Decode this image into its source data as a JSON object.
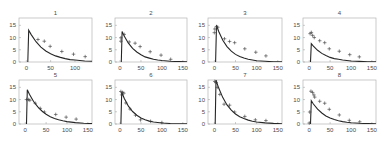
{
  "chart_data": {
    "type": "line",
    "ylim": [
      0,
      18
    ],
    "yticks": [
      0,
      5,
      10,
      15
    ],
    "grid": false,
    "legend": null,
    "panels": [
      {
        "title": "1",
        "xlim": [
          -15,
          135
        ],
        "xticks": [
          0,
          50,
          100
        ],
        "curve": [
          [
            3,
            0
          ],
          [
            5,
            13
          ],
          [
            10,
            11.2
          ],
          [
            20,
            8.3
          ],
          [
            30,
            6.1
          ],
          [
            40,
            4.5
          ],
          [
            50,
            3.4
          ],
          [
            60,
            2.5
          ],
          [
            70,
            1.9
          ],
          [
            80,
            1.4
          ],
          [
            90,
            1.0
          ],
          [
            100,
            0.8
          ],
          [
            110,
            0.6
          ],
          [
            120,
            0.4
          ],
          [
            135,
            0.3
          ]
        ],
        "observed": [
          [
            24,
            9.2
          ],
          [
            37,
            8.5
          ],
          [
            49,
            6.4
          ],
          [
            73,
            4.3
          ],
          [
            97,
            3.2
          ],
          [
            121,
            2.2
          ]
        ]
      },
      {
        "title": "2",
        "xlim": [
          -12,
          160
        ],
        "xticks": [
          0,
          50,
          100,
          150
        ],
        "curve": [
          [
            3,
            0
          ],
          [
            5,
            12.5
          ],
          [
            10,
            10.6
          ],
          [
            20,
            7.7
          ],
          [
            30,
            5.6
          ],
          [
            40,
            4.1
          ],
          [
            50,
            3.0
          ],
          [
            60,
            2.1
          ],
          [
            70,
            1.6
          ],
          [
            80,
            1.1
          ],
          [
            90,
            0.8
          ],
          [
            100,
            0.6
          ],
          [
            120,
            0.3
          ],
          [
            140,
            0.17
          ],
          [
            160,
            0.09
          ]
        ],
        "observed": [
          [
            2,
            9.9
          ],
          [
            2,
            8.5
          ],
          [
            10,
            11.3
          ],
          [
            22,
            8.2
          ],
          [
            36,
            7.7
          ],
          [
            48,
            6.3
          ],
          [
            72,
            4.2
          ],
          [
            98,
            2.8
          ],
          [
            121,
            1.1
          ]
        ]
      },
      {
        "title": "3",
        "xlim": [
          -15,
          160
        ],
        "xticks": [
          0,
          50,
          100,
          150
        ],
        "curve": [
          [
            3,
            0
          ],
          [
            5,
            15
          ],
          [
            10,
            12.6
          ],
          [
            20,
            8.9
          ],
          [
            30,
            6.3
          ],
          [
            40,
            4.4
          ],
          [
            50,
            3.1
          ],
          [
            60,
            2.2
          ],
          [
            70,
            1.6
          ],
          [
            80,
            1.1
          ],
          [
            90,
            0.8
          ],
          [
            100,
            0.5
          ],
          [
            120,
            0.27
          ],
          [
            140,
            0.13
          ],
          [
            160,
            0.07
          ]
        ],
        "observed": [
          [
            0,
            12
          ],
          [
            1,
            13.5
          ],
          [
            5,
            14.5
          ],
          [
            8,
            14.2
          ],
          [
            24,
            9.5
          ],
          [
            36,
            8.4
          ],
          [
            48,
            7.9
          ],
          [
            72,
            5.4
          ],
          [
            98,
            4.0
          ],
          [
            122,
            2.5
          ]
        ]
      },
      {
        "title": "4",
        "xlim": [
          -15,
          160
        ],
        "xticks": [
          0,
          50,
          100,
          150
        ],
        "curve": [
          [
            3,
            0
          ],
          [
            5,
            7.5
          ],
          [
            10,
            6.5
          ],
          [
            20,
            4.8
          ],
          [
            30,
            3.5
          ],
          [
            40,
            2.6
          ],
          [
            50,
            1.9
          ],
          [
            60,
            1.4
          ],
          [
            70,
            1.1
          ],
          [
            80,
            0.8
          ],
          [
            90,
            0.6
          ],
          [
            100,
            0.4
          ],
          [
            120,
            0.24
          ],
          [
            140,
            0.13
          ],
          [
            160,
            0.07
          ]
        ],
        "observed": [
          [
            2,
            11.6
          ],
          [
            5,
            12.1
          ],
          [
            8,
            10.9
          ],
          [
            12,
            10
          ],
          [
            25,
            8.7
          ],
          [
            37,
            7.9
          ],
          [
            48,
            5.4
          ],
          [
            72,
            4.4
          ],
          [
            97,
            3.0
          ],
          [
            120,
            2.1
          ]
        ]
      },
      {
        "title": "5",
        "xlim": [
          -15,
          160
        ],
        "xticks": [
          0,
          50,
          100,
          150
        ],
        "curve": [
          [
            3,
            0
          ],
          [
            5,
            14
          ],
          [
            10,
            12.2
          ],
          [
            20,
            9.2
          ],
          [
            30,
            7.0
          ],
          [
            40,
            5.3
          ],
          [
            50,
            4.0
          ],
          [
            60,
            3.0
          ],
          [
            70,
            2.3
          ],
          [
            80,
            1.7
          ],
          [
            90,
            1.3
          ],
          [
            100,
            1.0
          ],
          [
            120,
            0.56
          ],
          [
            140,
            0.32
          ],
          [
            160,
            0.18
          ]
        ],
        "observed": [
          [
            3,
            10
          ],
          [
            8,
            10
          ],
          [
            11,
            9.7
          ],
          [
            24,
            8.5
          ],
          [
            36,
            6.4
          ],
          [
            46,
            4.9
          ],
          [
            73,
            3.9
          ],
          [
            98,
            2.8
          ],
          [
            122,
            2.0
          ]
        ]
      },
      {
        "title": "6",
        "xlim": [
          -12,
          160
        ],
        "xticks": [
          0,
          50,
          100,
          150
        ],
        "curve": [
          [
            2,
            0
          ],
          [
            4,
            13
          ],
          [
            10,
            10.5
          ],
          [
            20,
            7.3
          ],
          [
            30,
            5.1
          ],
          [
            40,
            3.6
          ],
          [
            50,
            2.5
          ],
          [
            60,
            1.7
          ],
          [
            70,
            1.2
          ],
          [
            80,
            0.8
          ],
          [
            90,
            0.6
          ],
          [
            100,
            0.4
          ],
          [
            120,
            0.2
          ],
          [
            140,
            0.1
          ],
          [
            160,
            0.05
          ]
        ],
        "observed": [
          [
            2,
            13.3
          ],
          [
            6,
            12.9
          ],
          [
            9,
            12.6
          ],
          [
            4,
            11.9
          ],
          [
            14,
            8.6
          ],
          [
            24,
            6.1
          ],
          [
            37,
            3.6
          ],
          [
            49,
            1.7
          ],
          [
            73,
            1.1
          ],
          [
            100,
            0.6
          ]
        ]
      },
      {
        "title": "7",
        "xlim": [
          -15,
          160
        ],
        "xticks": [
          0,
          50,
          100,
          150
        ],
        "curve": [
          [
            2,
            0
          ],
          [
            4,
            18
          ],
          [
            10,
            14.8
          ],
          [
            20,
            10.8
          ],
          [
            30,
            7.8
          ],
          [
            40,
            5.7
          ],
          [
            50,
            4.1
          ],
          [
            60,
            3.0
          ],
          [
            70,
            2.2
          ],
          [
            80,
            1.6
          ],
          [
            90,
            1.15
          ],
          [
            100,
            0.83
          ],
          [
            120,
            0.44
          ],
          [
            140,
            0.23
          ],
          [
            160,
            0.12
          ]
        ],
        "observed": [
          [
            1,
            17.4
          ],
          [
            4,
            17
          ],
          [
            7,
            15
          ],
          [
            13,
            12.1
          ],
          [
            23,
            8.1
          ],
          [
            36,
            7.7
          ],
          [
            48,
            4.9
          ],
          [
            72,
            3.1
          ],
          [
            97,
            1.7
          ],
          [
            122,
            1.4
          ]
        ]
      },
      {
        "title": "8",
        "xlim": [
          -15,
          160
        ],
        "xticks": [
          0,
          50,
          100,
          150
        ],
        "curve": [
          [
            3,
            0
          ],
          [
            5,
            9.5
          ],
          [
            10,
            8.2
          ],
          [
            20,
            6.1
          ],
          [
            30,
            4.5
          ],
          [
            40,
            3.3
          ],
          [
            50,
            2.5
          ],
          [
            60,
            1.8
          ],
          [
            70,
            1.35
          ],
          [
            80,
            1.0
          ],
          [
            90,
            0.74
          ],
          [
            100,
            0.55
          ],
          [
            120,
            0.3
          ],
          [
            140,
            0.17
          ],
          [
            160,
            0.09
          ]
        ],
        "observed": [
          [
            0,
            0.4
          ],
          [
            1,
            4.9
          ],
          [
            4,
            13.4
          ],
          [
            8,
            12.9
          ],
          [
            11,
            11.9
          ],
          [
            13,
            11
          ],
          [
            25,
            9.3
          ],
          [
            37,
            8.5
          ],
          [
            48,
            6
          ],
          [
            72,
            3.7
          ],
          [
            96,
            1.5
          ],
          [
            121,
            0.9
          ]
        ]
      }
    ]
  }
}
